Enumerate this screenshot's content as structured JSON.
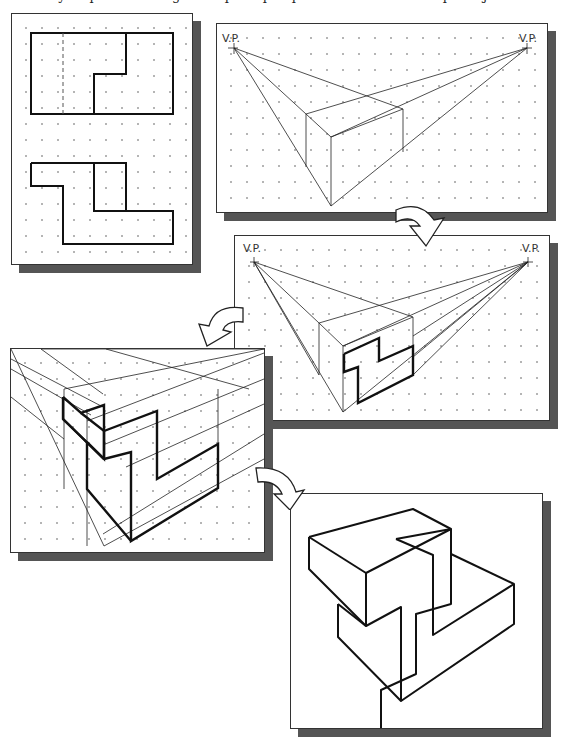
{
  "caption": "necessary steps in creating a two-point perspective sketch of a simple object are illustrated.",
  "panels": [
    {
      "id": "orthographic-views",
      "description": "Top and front orthographic views of an L-shaped block on a dot grid"
    },
    {
      "id": "perspective-box",
      "description": "Bounding box drawn in two-point perspective",
      "labels": {
        "vp_left": "V.P.",
        "vp_right": "V.P."
      }
    },
    {
      "id": "perspective-front-profile",
      "description": "Front profile sketched on the bounding box",
      "labels": {
        "vp_left": "V.P.",
        "vp_right": "V.P."
      }
    },
    {
      "id": "perspective-projection",
      "description": "Features projected to vanishing points"
    },
    {
      "id": "final-object",
      "description": "Completed perspective sketch"
    }
  ],
  "arrows": [
    "step-1-to-2",
    "step-2-to-3",
    "step-3-to-4",
    "step-4-to-5"
  ]
}
